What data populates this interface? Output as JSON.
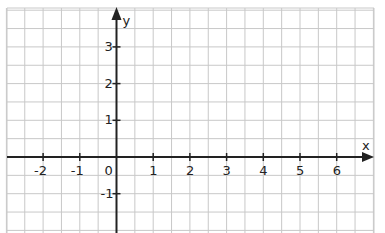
{
  "diagram": {
    "type": "coordinate-plane",
    "grid": {
      "left_px": 7,
      "right_px": 374,
      "top_px": 8,
      "bottom_px": 233,
      "origin_x_px": 116.5,
      "origin_y_px": 157,
      "unit_px": 36.7,
      "minor_step_units": 0.5,
      "line_color": "#c8c8c8",
      "axis_color": "#222222"
    },
    "axes": {
      "x_label": "x",
      "y_label": "y"
    },
    "x_ticks": [
      {
        "value": -2,
        "label": "-2"
      },
      {
        "value": -1,
        "label": "-1"
      },
      {
        "value": 1,
        "label": "1"
      },
      {
        "value": 2,
        "label": "2"
      },
      {
        "value": 3,
        "label": "3"
      },
      {
        "value": 4,
        "label": "4"
      },
      {
        "value": 5,
        "label": "5"
      },
      {
        "value": 6,
        "label": "6"
      }
    ],
    "y_ticks": [
      {
        "value": 3,
        "label": "3"
      },
      {
        "value": 2,
        "label": "2"
      },
      {
        "value": 1,
        "label": "1"
      },
      {
        "value": -1,
        "label": "-1"
      }
    ],
    "origin_label": "0"
  }
}
